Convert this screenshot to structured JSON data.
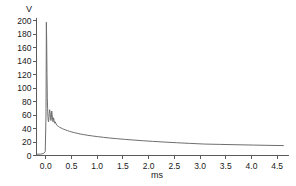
{
  "chart_data": {
    "type": "line",
    "title": "",
    "subtitle": "",
    "xlabel": "ms",
    "ylabel": "V",
    "xlim": [
      -0.18,
      4.72
    ],
    "ylim": [
      0,
      205
    ],
    "grid": false,
    "legend": null,
    "xticks": [
      "0.0",
      "0.5",
      "1.0",
      "1.5",
      "2.0",
      "2.5",
      "3.0",
      "3.5",
      "4.0",
      "4.5"
    ],
    "xtick_values": [
      0.0,
      0.5,
      1.0,
      1.5,
      2.0,
      2.5,
      3.0,
      3.5,
      4.0,
      4.5
    ],
    "yticks": [
      "0",
      "20",
      "40",
      "60",
      "80",
      "100",
      "120",
      "140",
      "160",
      "180",
      "200"
    ],
    "ytick_values": [
      0,
      20,
      40,
      60,
      80,
      100,
      120,
      140,
      160,
      180,
      200
    ],
    "line_color": "#6e6e6e",
    "axis_color": "#5a5a5a",
    "background_color": "#ffffff",
    "series": [
      {
        "name": "voltage",
        "x": [
          -0.17,
          -0.1,
          -0.04,
          -0.01,
          0.005,
          0.012,
          0.018,
          0.024,
          0.03,
          0.036,
          0.042,
          0.048,
          0.054,
          0.06,
          0.068,
          0.076,
          0.084,
          0.092,
          0.1,
          0.108,
          0.116,
          0.124,
          0.132,
          0.142,
          0.152,
          0.162,
          0.172,
          0.185,
          0.2,
          0.215,
          0.232,
          0.25,
          0.27,
          0.295,
          0.32,
          0.35,
          0.385,
          0.42,
          0.46,
          0.505,
          0.555,
          0.61,
          0.67,
          0.74,
          0.82,
          0.91,
          1.01,
          1.12,
          1.24,
          1.38,
          1.53,
          1.7,
          1.88,
          2.08,
          2.3,
          2.54,
          2.8,
          3.08,
          3.38,
          3.7,
          4.04,
          4.38,
          4.62
        ],
        "y": [
          2,
          2,
          3,
          6,
          60,
          198,
          170,
          120,
          86,
          70,
          58,
          52,
          50,
          54,
          62,
          68,
          64,
          57,
          52,
          56,
          66,
          61,
          54,
          50,
          56,
          52,
          48,
          50,
          47,
          45,
          44,
          43,
          42,
          41,
          40,
          39,
          38,
          37,
          36,
          35,
          34,
          33,
          32,
          31,
          30,
          29,
          28,
          27,
          26,
          25,
          24,
          23,
          22,
          21,
          20,
          19,
          18,
          17,
          16.5,
          16,
          15.5,
          15,
          14.7
        ]
      }
    ],
    "annotations": {
      "peak_voltage": 198,
      "peak_time_ms": 0.012,
      "baseline_voltage": 2,
      "final_voltage": 14.7
    }
  }
}
